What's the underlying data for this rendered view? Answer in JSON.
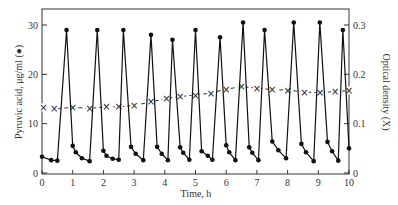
{
  "chart_data": {
    "type": "line",
    "title": "",
    "xlabel": "Time, h",
    "ylabel": "Pyruvic acid, μg/ml (●)",
    "y2label": "Optical density (X)",
    "xlim": [
      0,
      10
    ],
    "ylim": [
      0,
      33
    ],
    "y2lim": [
      0,
      0.33
    ],
    "grid": false,
    "legend": "none (series identified by axis labels)",
    "x_ticks": [
      "0",
      "1",
      "2",
      "3",
      "4",
      "5",
      "6",
      "7",
      "8",
      "9",
      "10"
    ],
    "y_ticks": [
      "0",
      "10",
      "20",
      "30"
    ],
    "y2_ticks": [
      "0",
      "0.1",
      "0.2",
      "0.3"
    ],
    "series": [
      {
        "name": "Pyruvic acid (μg/ml)",
        "marker": "filled-circle",
        "axis": "left",
        "style": "solid",
        "x": [
          0.0,
          0.3,
          0.5,
          0.8,
          1.0,
          1.1,
          1.3,
          1.55,
          1.8,
          2.0,
          2.1,
          2.3,
          2.5,
          2.65,
          2.9,
          3.05,
          3.3,
          3.55,
          3.75,
          3.9,
          4.1,
          4.25,
          4.5,
          4.6,
          4.8,
          5.0,
          5.2,
          5.4,
          5.55,
          5.8,
          6.0,
          6.1,
          6.3,
          6.55,
          6.75,
          6.85,
          7.05,
          7.25,
          7.5,
          7.7,
          7.95,
          8.2,
          8.45,
          8.6,
          8.85,
          9.05,
          9.3,
          9.45,
          9.65,
          9.8,
          10.0
        ],
        "values": [
          3.3,
          2.6,
          2.5,
          29,
          5.5,
          4.2,
          3.0,
          2.4,
          29,
          4.5,
          3.5,
          2.9,
          2.7,
          29,
          5.3,
          3.9,
          2.6,
          28,
          5.3,
          3.9,
          2.6,
          27,
          5.2,
          4.1,
          2.7,
          29,
          4.4,
          3.5,
          2.7,
          27.5,
          5.6,
          4.2,
          2.6,
          30.5,
          5.2,
          4.1,
          2.6,
          29,
          6.4,
          4.6,
          3.0,
          30.5,
          5.9,
          4.2,
          2.4,
          30.5,
          6.3,
          4.4,
          2.5,
          29,
          5.0
        ]
      },
      {
        "name": "Optical density",
        "marker": "x",
        "axis": "right",
        "style": "dashed",
        "x": [
          0.05,
          0.4,
          1.0,
          1.55,
          2.1,
          2.5,
          3.0,
          3.55,
          4.05,
          4.5,
          5.0,
          5.5,
          6.0,
          6.5,
          7.0,
          7.5,
          8.0,
          8.55,
          9.05,
          9.55,
          10.0
        ],
        "values": [
          0.133,
          0.13,
          0.133,
          0.131,
          0.134,
          0.134,
          0.137,
          0.144,
          0.151,
          0.155,
          0.158,
          0.162,
          0.17,
          0.175,
          0.172,
          0.169,
          0.168,
          0.164,
          0.163,
          0.165,
          0.167
        ]
      }
    ]
  }
}
